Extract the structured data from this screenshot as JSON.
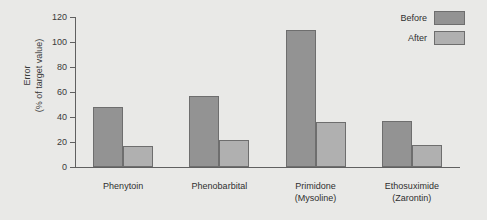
{
  "chart_data": {
    "type": "bar",
    "title": "",
    "xlabel": "",
    "ylabel": "Error (% of target value)",
    "ylabel_line1": "Error",
    "ylabel_line2": "(% of target value)",
    "ylim": [
      0,
      120
    ],
    "yticks": [
      0,
      20,
      40,
      60,
      80,
      100,
      120
    ],
    "ytick_labels": [
      "0",
      "20",
      "40",
      "60",
      "80",
      "100",
      "120"
    ],
    "grid": false,
    "legend_position": "top-right",
    "categories": [
      "Phenytoin",
      "Phenobarbital",
      "Primidone (Mysoline)",
      "Ethosuximide (Zarontin)"
    ],
    "category_lines": [
      [
        "Phenytoin",
        ""
      ],
      [
        "Phenobarbital",
        ""
      ],
      [
        "Primidone",
        "(Mysoline)"
      ],
      [
        "Ethosuximide",
        "(Zarontin)"
      ]
    ],
    "series": [
      {
        "name": "Before",
        "color": "#939393",
        "values": [
          48,
          57,
          110,
          37
        ]
      },
      {
        "name": "After",
        "color": "#b0b0b0",
        "values": [
          17,
          22,
          36,
          18
        ]
      }
    ]
  },
  "legend": {
    "items": [
      {
        "label": "Before",
        "color": "#939393"
      },
      {
        "label": "After",
        "color": "#b0b0b0"
      }
    ]
  },
  "colors": {
    "background": "#e9e9e7",
    "axis": "#606060",
    "bar_border": "#6e6e6e",
    "before": "#939393",
    "after": "#b0b0b0",
    "text": "#2f2f2f"
  }
}
